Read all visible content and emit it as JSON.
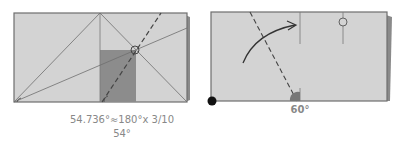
{
  "diagrams": [
    {
      "name": "left-step",
      "caption_line1": "54.736°≈180°x 3/10",
      "caption_line2": "54°"
    },
    {
      "name": "right-step",
      "caption_angle": "60°"
    }
  ],
  "colors": {
    "paper": "#d3d3d3",
    "paper_back": "#8a8a8a",
    "shaded": "#8c8c8c",
    "line": "#6e6e6e",
    "caption": "#888888"
  }
}
